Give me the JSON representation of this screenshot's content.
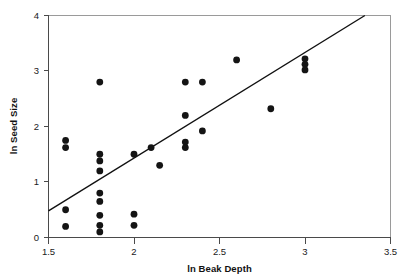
{
  "chart_data": {
    "type": "scatter",
    "title": "",
    "xlabel": "ln Beak Depth",
    "ylabel": "ln Seed Size",
    "xlim": [
      1.5,
      3.5
    ],
    "ylim": [
      0,
      4
    ],
    "grid": false,
    "legend": "none",
    "xticks": [
      1.5,
      2,
      2.5,
      3,
      3.5
    ],
    "xtick_labels": [
      "1.5",
      "2",
      "2.5",
      "3",
      "3.5"
    ],
    "yticks": [
      0,
      1,
      2,
      3,
      4
    ],
    "ytick_labels": [
      "0",
      "1",
      "2",
      "3",
      "4"
    ],
    "points": [
      {
        "x": 1.6,
        "y": 1.75
      },
      {
        "x": 1.6,
        "y": 1.62
      },
      {
        "x": 1.6,
        "y": 0.5
      },
      {
        "x": 1.6,
        "y": 0.2
      },
      {
        "x": 1.8,
        "y": 2.8
      },
      {
        "x": 1.8,
        "y": 1.5
      },
      {
        "x": 1.8,
        "y": 1.38
      },
      {
        "x": 1.8,
        "y": 1.2
      },
      {
        "x": 1.8,
        "y": 0.8
      },
      {
        "x": 1.8,
        "y": 0.65
      },
      {
        "x": 1.8,
        "y": 0.4
      },
      {
        "x": 1.8,
        "y": 0.22
      },
      {
        "x": 1.8,
        "y": 0.1
      },
      {
        "x": 2.0,
        "y": 1.5
      },
      {
        "x": 2.0,
        "y": 0.42
      },
      {
        "x": 2.0,
        "y": 0.22
      },
      {
        "x": 2.1,
        "y": 1.62
      },
      {
        "x": 2.15,
        "y": 1.3
      },
      {
        "x": 2.3,
        "y": 2.8
      },
      {
        "x": 2.3,
        "y": 2.2
      },
      {
        "x": 2.3,
        "y": 1.72
      },
      {
        "x": 2.3,
        "y": 1.62
      },
      {
        "x": 2.4,
        "y": 2.8
      },
      {
        "x": 2.4,
        "y": 1.92
      },
      {
        "x": 2.6,
        "y": 3.2
      },
      {
        "x": 2.8,
        "y": 2.32
      },
      {
        "x": 3.0,
        "y": 3.22
      },
      {
        "x": 3.0,
        "y": 3.12
      },
      {
        "x": 3.0,
        "y": 3.02
      }
    ],
    "trendline": {
      "label": "regression line",
      "x_start": 1.5,
      "y_start": 0.48,
      "x_end": 3.35,
      "y_end": 4.0
    }
  },
  "axes": {
    "x_title": "ln Beak Depth",
    "y_title": "ln Seed Size"
  }
}
